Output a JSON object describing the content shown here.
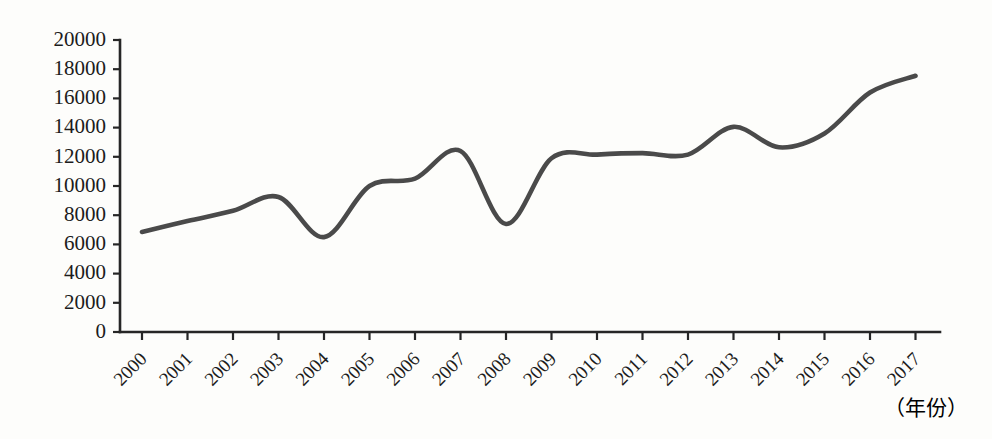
{
  "chart_data": {
    "type": "line",
    "title": "",
    "xlabel": "（年份）",
    "ylabel": "",
    "grid": false,
    "legend": false,
    "legend_position": "none",
    "line_color": "#4a4a4a",
    "background_color": "#fdfdfb",
    "axis_color": "#262626",
    "categories": [
      "2000",
      "2001",
      "2002",
      "2003",
      "2004",
      "2005",
      "2006",
      "2007",
      "2008",
      "2009",
      "2010",
      "2011",
      "2012",
      "2013",
      "2014",
      "2015",
      "2016",
      "2017"
    ],
    "values": [
      6850,
      7600,
      8300,
      9250,
      6500,
      10000,
      10500,
      12400,
      7400,
      11900,
      12150,
      12250,
      12150,
      14050,
      12650,
      13600,
      16400,
      17550
    ],
    "x": [
      "2000",
      "2001",
      "2002",
      "2003",
      "2004",
      "2005",
      "2006",
      "2007",
      "2008",
      "2009",
      "2010",
      "2011",
      "2012",
      "2013",
      "2014",
      "2015",
      "2016",
      "2017"
    ],
    "ylim": [
      0,
      20000
    ],
    "ytick_labels": [
      "20000",
      "18000",
      "16000",
      "14000",
      "12000",
      "10000",
      "8000",
      "6000",
      "4000",
      "2000",
      "0"
    ],
    "ytick_values": [
      20000,
      18000,
      16000,
      14000,
      12000,
      10000,
      8000,
      6000,
      4000,
      2000,
      0
    ],
    "ytick_step": 2000,
    "xtick_labels": [
      "2000",
      "2001",
      "2002",
      "2003",
      "2004",
      "2005",
      "2006",
      "2007",
      "2008",
      "2009",
      "2010",
      "2011",
      "2012",
      "2013",
      "2014",
      "2015",
      "2016",
      "2017"
    ],
    "xtick_rotation": 45,
    "annotations": []
  },
  "axis": {
    "x_caption": "（年份）"
  }
}
